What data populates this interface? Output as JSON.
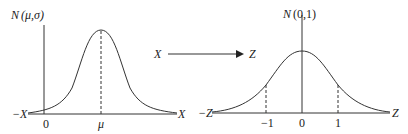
{
  "left_plot": {
    "title": "N (μ,σ)",
    "title_N": "N",
    "title_args": "(μ,σ)",
    "x_left_label": "−X",
    "x_right_label": "X",
    "tick_zero": "0",
    "tick_mu": "μ"
  },
  "transform": {
    "from": "X",
    "to": "Z"
  },
  "right_plot": {
    "title": "N (0,1)",
    "title_N": "N",
    "title_args": "(0,1)",
    "x_left_label": "−Z",
    "x_right_label": "Z",
    "ticks": [
      "−1",
      "0",
      "1"
    ]
  },
  "colors": {
    "line": "#333333",
    "background": "#ffffff"
  }
}
